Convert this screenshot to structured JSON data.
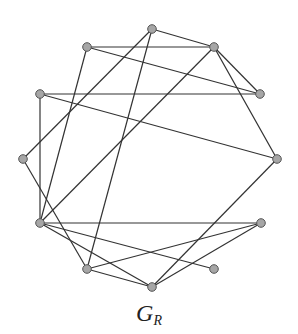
{
  "figure": {
    "label_main": "G",
    "label_sub": "R",
    "colors": {
      "edge": "#333333",
      "node_fill": "#a6a6a6",
      "node_stroke": "#555555"
    }
  },
  "graph": {
    "nodes": [
      {
        "id": "A",
        "x": 152,
        "y": 29
      },
      {
        "id": "B",
        "x": 87,
        "y": 47
      },
      {
        "id": "C",
        "x": 214,
        "y": 47
      },
      {
        "id": "D",
        "x": 40,
        "y": 94
      },
      {
        "id": "E",
        "x": 260,
        "y": 94
      },
      {
        "id": "F",
        "x": 23,
        "y": 159
      },
      {
        "id": "G",
        "x": 277,
        "y": 159
      },
      {
        "id": "H",
        "x": 40,
        "y": 223
      },
      {
        "id": "I",
        "x": 261,
        "y": 223
      },
      {
        "id": "J",
        "x": 87,
        "y": 269
      },
      {
        "id": "K",
        "x": 214,
        "y": 269
      },
      {
        "id": "L",
        "x": 152,
        "y": 287
      }
    ],
    "edges": [
      [
        "A",
        "C"
      ],
      [
        "A",
        "F"
      ],
      [
        "A",
        "J"
      ],
      [
        "B",
        "C"
      ],
      [
        "B",
        "E"
      ],
      [
        "B",
        "H"
      ],
      [
        "C",
        "E"
      ],
      [
        "C",
        "H"
      ],
      [
        "C",
        "G"
      ],
      [
        "D",
        "E"
      ],
      [
        "D",
        "H"
      ],
      [
        "D",
        "G"
      ],
      [
        "F",
        "J"
      ],
      [
        "H",
        "I"
      ],
      [
        "H",
        "K"
      ],
      [
        "H",
        "L"
      ],
      [
        "J",
        "I"
      ],
      [
        "J",
        "L"
      ],
      [
        "L",
        "I"
      ],
      [
        "L",
        "G"
      ]
    ]
  }
}
